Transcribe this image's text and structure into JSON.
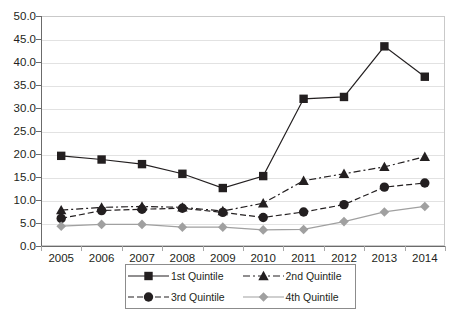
{
  "chart_data": {
    "type": "line",
    "title": "",
    "subtitle": "",
    "xlabel": "",
    "ylabel": "",
    "categories": [
      "2005",
      "2006",
      "2007",
      "2008",
      "2009",
      "2010",
      "2011",
      "2012",
      "2013",
      "2014"
    ],
    "x_tick_labels": [
      "2005",
      "2006",
      "2007",
      "2008",
      "2009",
      "2010",
      "2011",
      "2012",
      "2013",
      "2014"
    ],
    "y_tick_labels": [
      "0.0",
      "5.0",
      "10.0",
      "15.0",
      "20.0",
      "25.0",
      "30.0",
      "35.0",
      "40.0",
      "45.0",
      "50.0"
    ],
    "ylim": [
      0.0,
      50.0
    ],
    "y_tick_step": 5.0,
    "grid": true,
    "grid_axis": "y",
    "legend_position": "bottom",
    "series": [
      {
        "name": "1st Quintile",
        "marker": "square",
        "line_style": "solid",
        "color": "#231f20",
        "values": [
          19.6,
          18.8,
          17.8,
          15.7,
          12.6,
          15.2,
          32.0,
          32.4,
          43.4,
          36.8
        ]
      },
      {
        "name": "2nd Quintile",
        "marker": "triangle",
        "line_style": "dash-dot",
        "color": "#231f20",
        "values": [
          7.8,
          8.4,
          8.6,
          8.4,
          7.6,
          9.3,
          14.2,
          15.7,
          17.2,
          19.4
        ]
      },
      {
        "name": "3rd Quintile",
        "marker": "circle",
        "line_style": "dashed",
        "color": "#231f20",
        "values": [
          6.0,
          7.7,
          8.0,
          8.2,
          7.3,
          6.2,
          7.4,
          9.0,
          12.8,
          13.7
        ]
      },
      {
        "name": "4th Quintile",
        "marker": "diamond",
        "line_style": "solid",
        "color": "#a0a0a0",
        "values": [
          4.3,
          4.7,
          4.7,
          4.1,
          4.1,
          3.5,
          3.6,
          5.3,
          7.4,
          8.6
        ]
      }
    ]
  },
  "legend": {
    "entries": [
      {
        "label": "1st Quintile"
      },
      {
        "label": "2nd Quintile"
      },
      {
        "label": "3rd Quintile"
      },
      {
        "label": "4th Quintile"
      }
    ]
  },
  "colors": {
    "dark": "#231f20",
    "gray": "#a0a0a0",
    "grid": "#e2e2e2",
    "axis": "#6b6b6b",
    "frame": "#c9c9c9",
    "legend_border": "#8c8c8c",
    "background": "#ffffff"
  }
}
